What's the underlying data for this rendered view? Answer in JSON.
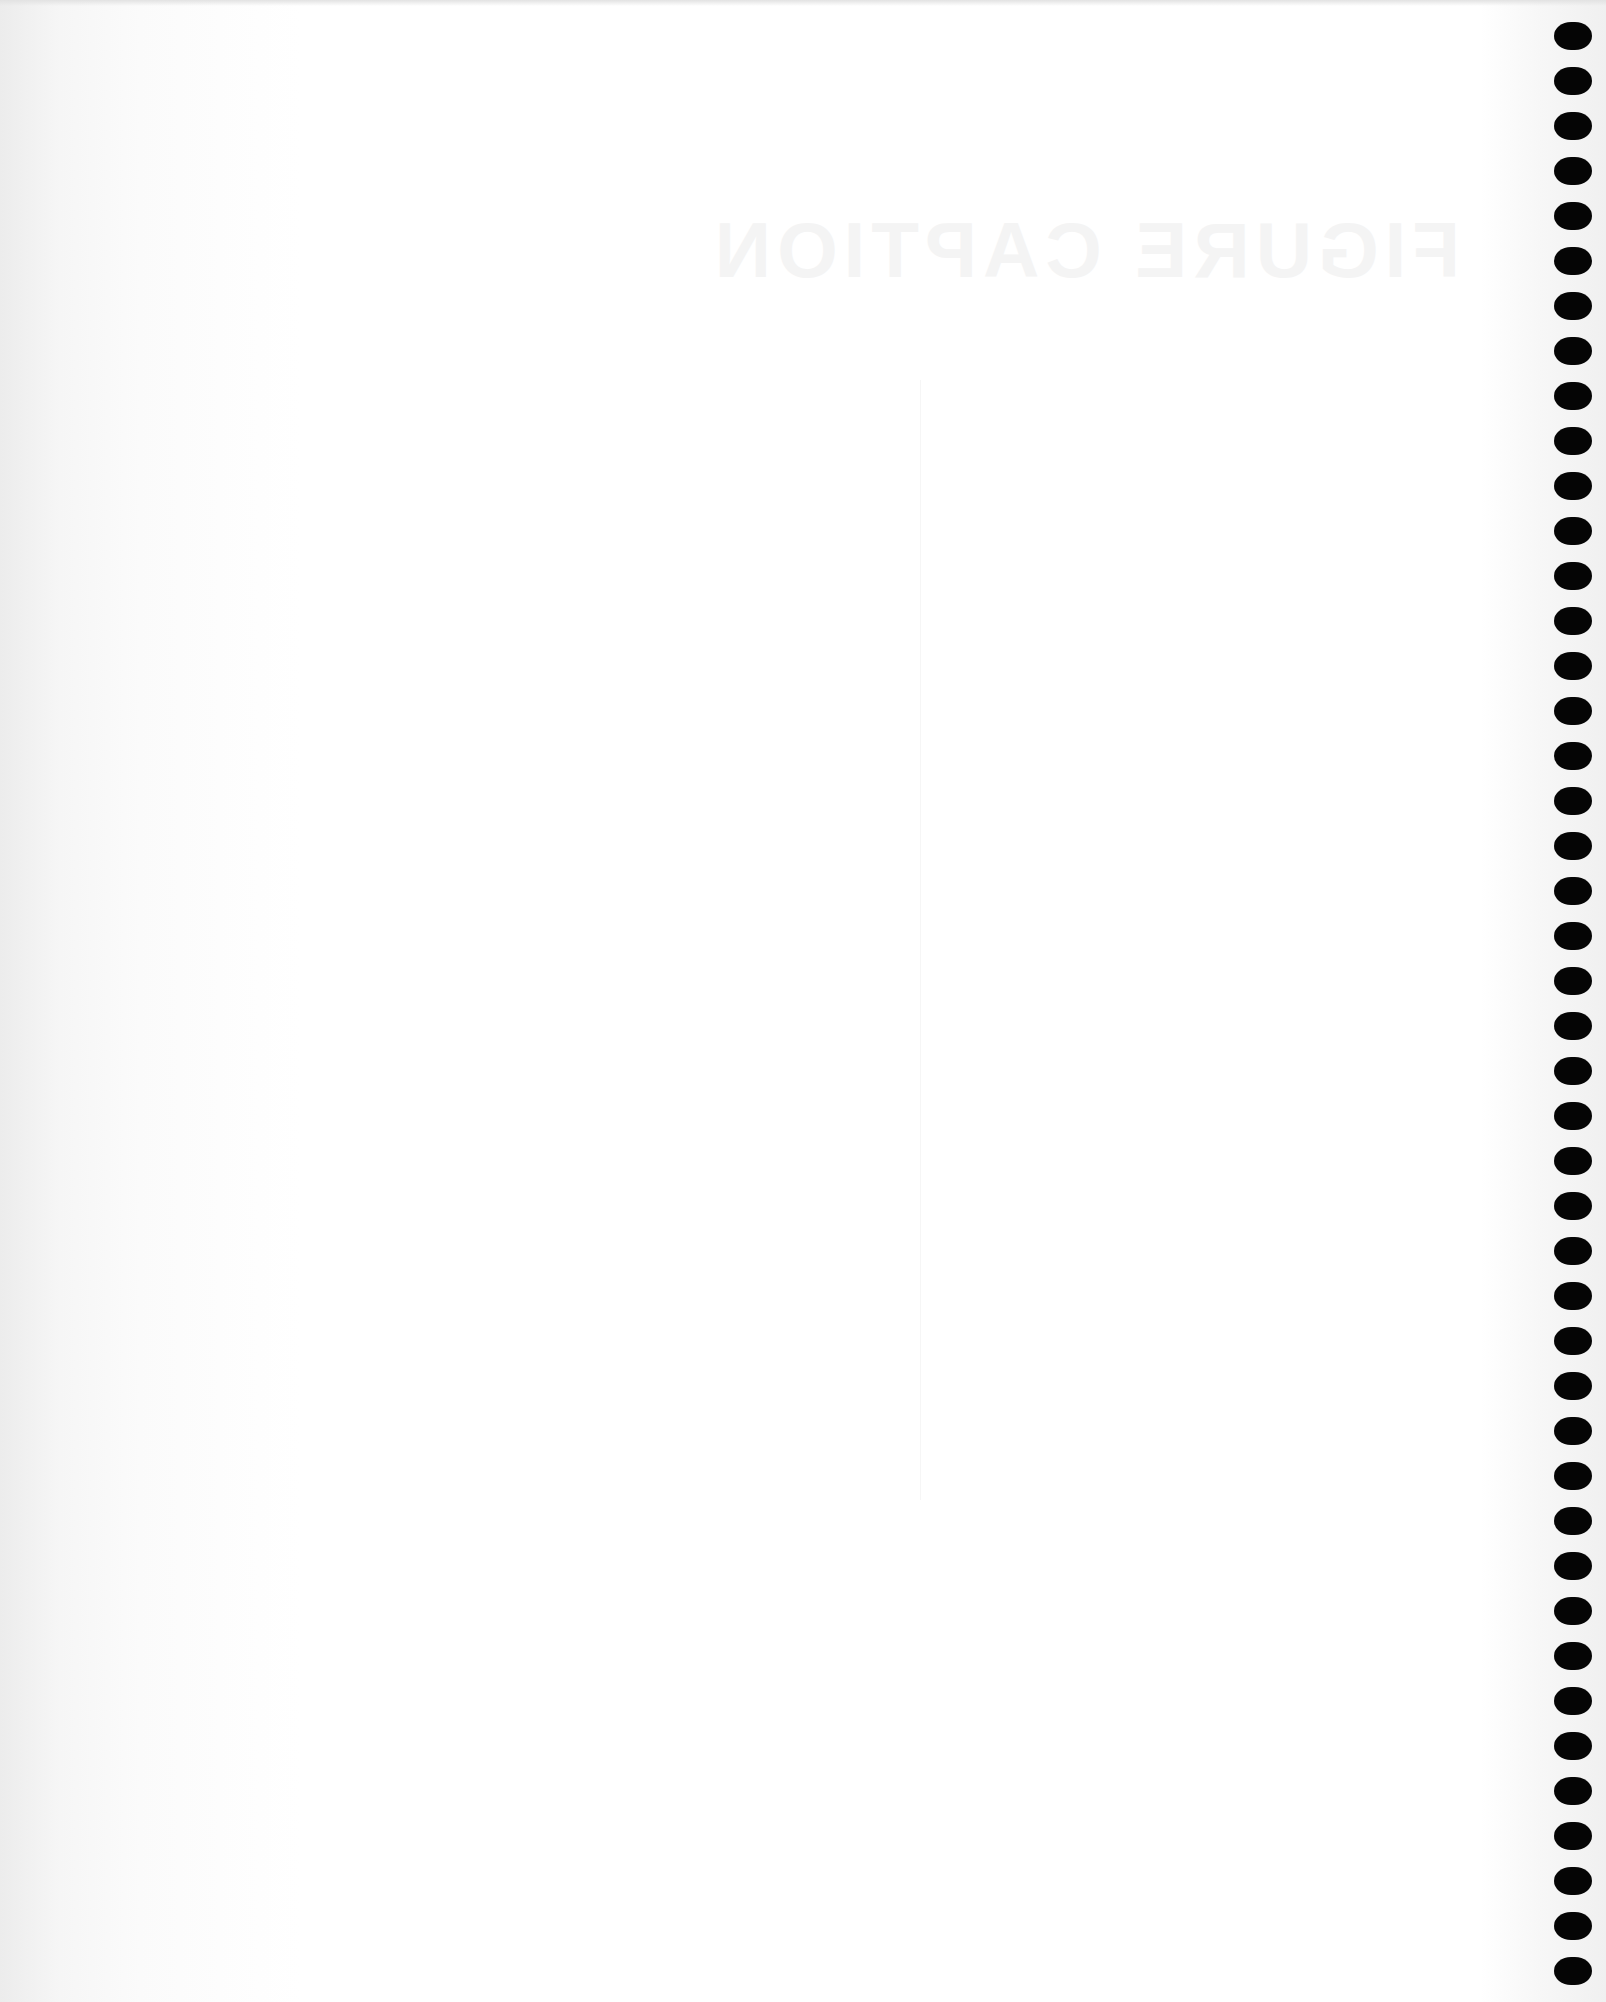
{
  "page": {
    "type": "scanned blank sheet",
    "showthrough_title": "FIGURE CAPTION"
  },
  "binding": {
    "hole_count": 44,
    "hole_color": "#050505",
    "first_hole_top": 22,
    "hole_spacing": 45
  }
}
